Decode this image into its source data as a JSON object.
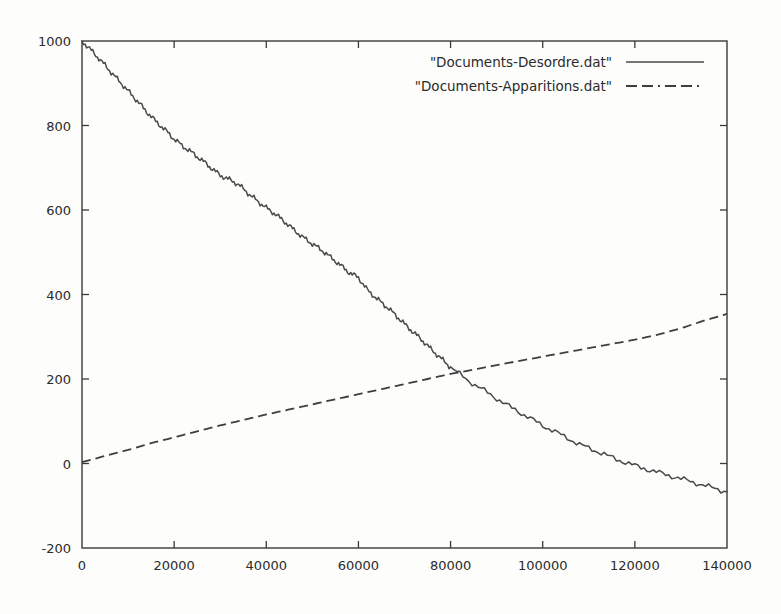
{
  "chart_data": {
    "type": "line",
    "title": "",
    "xlabel": "",
    "ylabel": "",
    "xlim": [
      0,
      140000
    ],
    "ylim": [
      -200,
      1000
    ],
    "grid": false,
    "legend_position": "top-right",
    "xticks": [
      0,
      20000,
      40000,
      60000,
      80000,
      100000,
      120000,
      140000
    ],
    "xtick_labels": [
      "0",
      "20000",
      "40000",
      "60000",
      "80000",
      "100000",
      "120000",
      "140000"
    ],
    "yticks": [
      -200,
      0,
      200,
      400,
      600,
      800,
      1000
    ],
    "ytick_labels": [
      "-200",
      "0",
      "200",
      "400",
      "600",
      "800",
      "1000"
    ],
    "series": [
      {
        "name": "\"Documents-Desordre.dat\"",
        "style": "solid",
        "color": "#4a4a4a",
        "x": [
          0,
          2000,
          4000,
          6000,
          8000,
          10000,
          12000,
          14000,
          16000,
          18000,
          20000,
          22000,
          24000,
          26000,
          28000,
          30000,
          32000,
          34000,
          36000,
          38000,
          40000,
          42000,
          44000,
          46000,
          48000,
          50000,
          52000,
          54000,
          56000,
          58000,
          60000,
          62000,
          64000,
          66000,
          68000,
          70000,
          72000,
          74000,
          76000,
          78000,
          80000,
          84000,
          88000,
          92000,
          96000,
          100000,
          104000,
          108000,
          112000,
          116000,
          120000,
          124000,
          128000,
          132000,
          136000,
          140000
        ],
        "y": [
          1000,
          978,
          955,
          930,
          906,
          882,
          858,
          833,
          810,
          790,
          768,
          750,
          735,
          718,
          700,
          682,
          672,
          660,
          640,
          622,
          605,
          590,
          572,
          553,
          535,
          520,
          505,
          488,
          470,
          452,
          440,
          410,
          390,
          372,
          352,
          330,
          310,
          290,
          268,
          248,
          228,
          195,
          168,
          140,
          115,
          90,
          68,
          45,
          28,
          10,
          -5,
          -18,
          -30,
          -42,
          -55,
          -67
        ]
      },
      {
        "name": "\"Documents-Apparitions.dat\"",
        "style": "dashed",
        "color": "#3f3f3f",
        "x": [
          0,
          5000,
          10000,
          15000,
          20000,
          25000,
          30000,
          35000,
          40000,
          45000,
          50000,
          55000,
          60000,
          65000,
          70000,
          75000,
          80000,
          85000,
          90000,
          95000,
          100000,
          105000,
          110000,
          115000,
          120000,
          125000,
          130000,
          135000,
          140000
        ],
        "y": [
          3,
          18,
          32,
          48,
          62,
          76,
          90,
          103,
          116,
          128,
          140,
          152,
          164,
          176,
          188,
          200,
          212,
          222,
          233,
          243,
          253,
          263,
          273,
          283,
          293,
          305,
          320,
          338,
          354
        ]
      }
    ],
    "annotations": {
      "crossing_point": {
        "x": 75000,
        "y": 202
      }
    }
  },
  "legend": {
    "entries": [
      {
        "label": "\"Documents-Desordre.dat\"",
        "style": "solid"
      },
      {
        "label": "\"Documents-Apparitions.dat\"",
        "style": "dashed"
      }
    ]
  }
}
